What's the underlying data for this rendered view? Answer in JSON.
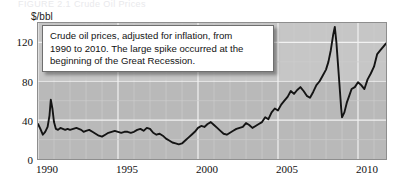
{
  "figure": {
    "top_caption_remnant": "FIGURE 2.1    Crude Oil Prices",
    "callout_lines": [
      "Crude oil prices, adjusted for inflation, from",
      "1990 to 2010. The large spike occurred at the",
      "beginning of the Great Recession."
    ]
  },
  "chart_data": {
    "type": "line",
    "title": "",
    "xlabel": "",
    "ylabel": "$/bbl",
    "xlim": [
      1990,
      2011.75
    ],
    "ylim": [
      0,
      140
    ],
    "yticks": [
      0,
      40,
      80,
      120
    ],
    "ytick_labels": [
      "0",
      "40",
      "80",
      "120"
    ],
    "xticks": [
      1990,
      1995,
      2000,
      2005,
      2010
    ],
    "xtick_labels": [
      "1990",
      "1995",
      "2000",
      "2005",
      "2010"
    ],
    "grid": true,
    "grid_color": "#e6e6e6",
    "plot_background": "#b9b9b9",
    "line_color": "#141414",
    "legend": "none",
    "series": [
      {
        "name": "Crude oil price (inflation adjusted, $/bbl)",
        "x": [
          1990.0,
          1990.15,
          1990.3,
          1990.45,
          1990.6,
          1990.72,
          1990.8,
          1990.9,
          1991.0,
          1991.12,
          1991.25,
          1991.4,
          1991.55,
          1991.7,
          1991.85,
          1992.0,
          1992.2,
          1992.4,
          1992.55,
          1992.7,
          1992.85,
          1993.0,
          1993.2,
          1993.4,
          1993.6,
          1993.8,
          1994.0,
          1994.2,
          1994.4,
          1994.6,
          1994.8,
          1995.0,
          1995.2,
          1995.4,
          1995.6,
          1995.8,
          1996.0,
          1996.2,
          1996.4,
          1996.6,
          1996.8,
          1997.0,
          1997.2,
          1997.4,
          1997.6,
          1997.8,
          1998.0,
          1998.2,
          1998.4,
          1998.6,
          1998.8,
          1999.0,
          1999.2,
          1999.4,
          1999.6,
          1999.8,
          2000.0,
          2000.2,
          2000.4,
          2000.6,
          2000.8,
          2001.0,
          2001.2,
          2001.4,
          2001.6,
          2001.8,
          2002.0,
          2002.2,
          2002.4,
          2002.6,
          2002.8,
          2003.0,
          2003.2,
          2003.4,
          2003.6,
          2003.8,
          2004.0,
          2004.2,
          2004.4,
          2004.6,
          2004.8,
          2005.0,
          2005.2,
          2005.4,
          2005.6,
          2005.8,
          2006.0,
          2006.2,
          2006.4,
          2006.6,
          2006.8,
          2007.0,
          2007.2,
          2007.4,
          2007.6,
          2007.8,
          2008.0,
          2008.15,
          2008.3,
          2008.45,
          2008.55,
          2008.65,
          2008.8,
          2008.95,
          2009.0,
          2009.15,
          2009.3,
          2009.45,
          2009.6,
          2009.8,
          2010.0,
          2010.2,
          2010.4,
          2010.6,
          2010.8,
          2011.0,
          2011.2,
          2011.4,
          2011.6,
          2011.75
        ],
        "y": [
          36,
          31,
          25,
          28,
          33,
          45,
          61,
          52,
          38,
          31,
          30,
          32,
          31,
          30,
          31,
          30,
          31,
          32,
          31,
          30,
          28,
          29,
          30,
          28,
          26,
          24,
          23,
          25,
          27,
          28,
          29,
          28,
          27,
          28,
          28,
          27,
          28,
          30,
          31,
          29,
          32,
          31,
          27,
          25,
          26,
          24,
          21,
          19,
          17,
          16,
          15,
          16,
          19,
          22,
          25,
          28,
          32,
          34,
          33,
          36,
          38,
          35,
          32,
          29,
          26,
          25,
          27,
          29,
          31,
          32,
          33,
          37,
          35,
          32,
          34,
          36,
          38,
          43,
          41,
          48,
          52,
          50,
          56,
          60,
          64,
          70,
          67,
          71,
          74,
          70,
          65,
          63,
          69,
          76,
          80,
          86,
          92,
          100,
          112,
          128,
          136,
          120,
          86,
          52,
          43,
          48,
          58,
          65,
          72,
          74,
          79,
          76,
          72,
          82,
          88,
          95,
          108,
          112,
          116,
          119
        ]
      }
    ],
    "annotations": [
      {
        "text": "Crude oil prices, adjusted for inflation, from 1990 to 2010. The large spike occurred at the beginning of the Great Recession.",
        "type": "callout-box"
      }
    ]
  }
}
